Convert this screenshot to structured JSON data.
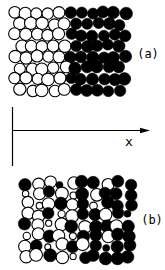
{
  "figure": {
    "background": "#ffffff",
    "ink": "#000000",
    "axis": {
      "label": "x",
      "label_pos": {
        "x": 129,
        "y": 146
      },
      "vline": {
        "x": 12.5,
        "y1": 107,
        "y2": 166
      },
      "hline": {
        "x1": 12.5,
        "x2": 150,
        "y": 130.5
      }
    },
    "panels": [
      {
        "id": "a",
        "label": "(a)",
        "label_pos": {
          "x": 148,
          "y": 58
        },
        "origin": {
          "x": 9.5,
          "y": 7
        },
        "radius_large": 5.9,
        "radius_small": 3.4,
        "col_spacing": 11.0,
        "row_spacing": 11.0,
        "stagger": 5.5,
        "jitter": 1.3,
        "seed": 11,
        "rows": [
          "OOOOOFFFFFF",
          "OOOOOFFFFF",
          "OOOOOFFFFFF",
          "OOOOOFFFFF",
          "OOOOOFFFFFF",
          "OOOOOFFFFF",
          "OOOOOFFFFFF",
          "OOOOOFFFFF"
        ]
      },
      {
        "id": "b",
        "label": "(b)",
        "label_pos": {
          "x": 152,
          "y": 224
        },
        "origin": {
          "x": 20,
          "y": 177
        },
        "radius_large": 6.1,
        "radius_small": 3.4,
        "col_spacing": 11.5,
        "row_spacing": 10.5,
        "stagger": 0,
        "jitter": 2.1,
        "seed": 29,
        "rows": [
          "FOOfOFFOFF",
          "oOFOoFOFFF",
          "OoOFOFoFFF",
          "OOFoOFFOFf",
          "FOoOFOFFOF",
          "oOFOoFFOFF",
          "OFoOFOFfFF",
          "OOFOoFFFFF"
        ]
      }
    ]
  }
}
